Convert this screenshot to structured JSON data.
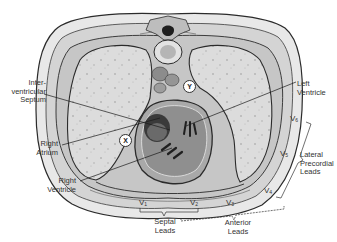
{
  "diagram": {
    "type": "anatomical cross-section",
    "colors": {
      "background": "#ffffff",
      "outline": "#2b2b2b",
      "tissue_light": "#e6e6e6",
      "tissue_mid": "#c8c8c8",
      "lung": "#d9d9d9",
      "heart_dark": "#4a4a4a",
      "label_text": "#333333"
    }
  },
  "labels": {
    "interventricular_septum": {
      "line1": "Inter-",
      "line2": "ventricular",
      "line3": "Septum"
    },
    "left_ventricle": {
      "line1": "Left",
      "line2": "Ventricle"
    },
    "right_atrium": {
      "line1": "Right",
      "line2": "Atrium"
    },
    "right_ventricle": {
      "line1": "Right",
      "line2": "Ventricle"
    }
  },
  "markers": {
    "x": "X",
    "y": "Y"
  },
  "leads": {
    "v1": {
      "base": "V",
      "sub": "1"
    },
    "v2": {
      "base": "V",
      "sub": "2"
    },
    "v3": {
      "base": "V",
      "sub": "3"
    },
    "v4": {
      "base": "V",
      "sub": "4"
    },
    "v5": {
      "base": "V",
      "sub": "5"
    },
    "v6": {
      "base": "V",
      "sub": "6"
    }
  },
  "groups": {
    "septal": {
      "line1": "Septal",
      "line2": "Leads"
    },
    "anterior": {
      "line1": "Anterior",
      "line2": "Leads"
    },
    "lateral": {
      "line1": "Lateral",
      "line2": "Precordial",
      "line3": "Leads"
    }
  }
}
